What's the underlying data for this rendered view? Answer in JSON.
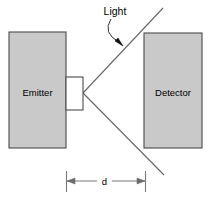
{
  "diagram": {
    "canvas": {
      "width": 211,
      "height": 201,
      "background": "#ffffff"
    },
    "colors": {
      "block_fill": "#c9c9c9",
      "block_stroke": "#4a4a4a",
      "aperture_fill": "#ffffff",
      "aperture_stroke": "#4a4a4a",
      "ray_stroke": "#6b6b6b",
      "dimension_stroke": "#7a7a7a",
      "text": "#000000"
    },
    "blocks": [
      {
        "id": "emitter",
        "label": "Emitter",
        "x": 9,
        "y": 32,
        "width": 57,
        "height": 116,
        "label_x": 37.5,
        "label_y": 92
      },
      {
        "id": "detector",
        "label": "Detector",
        "x": 144,
        "y": 33,
        "width": 58,
        "height": 115,
        "label_x": 173,
        "label_y": 92
      }
    ],
    "aperture": {
      "id": "emitter-aperture",
      "x": 66,
      "y": 77,
      "width": 17,
      "height": 33
    },
    "rays": {
      "vertex_x": 83,
      "vertex_y": 93,
      "upper_end_x": 163,
      "upper_end_y": 8,
      "lower_end_x": 164,
      "lower_end_y": 175
    },
    "callout": {
      "label": "Light",
      "label_x": 115,
      "label_y": 14,
      "leader_start_x": 111,
      "leader_start_y": 19,
      "leader_ctrl_x": 104,
      "leader_ctrl_y": 34,
      "leader_end_x": 119,
      "leader_end_y": 42,
      "arrow_tip_x": 122,
      "arrow_tip_y": 46
    },
    "dimension": {
      "label": "d",
      "label_x": 104,
      "label_y": 185,
      "line_y": 181,
      "left_x": 66,
      "right_x": 146,
      "tick_top": 171,
      "tick_bottom": 192,
      "gap_left": 96,
      "gap_right": 112
    }
  }
}
